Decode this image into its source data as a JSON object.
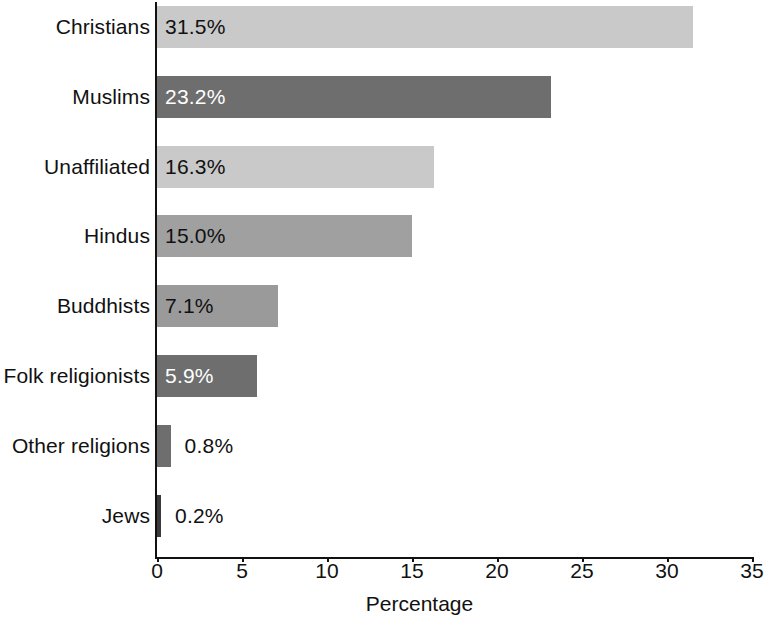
{
  "chart_data": {
    "type": "bar",
    "orientation": "horizontal",
    "title": "",
    "xlabel": "Percentage",
    "ylabel": "",
    "xlim": [
      0,
      35
    ],
    "xticks": [
      "0",
      "5",
      "10",
      "15",
      "20",
      "25",
      "30",
      "35"
    ],
    "grid": false,
    "legend": "none",
    "categories": [
      "Christians",
      "Muslims",
      "Unaffiliated",
      "Hindus",
      "Buddhists",
      "Folk religionists",
      "Other religions",
      "Jews"
    ],
    "values": [
      31.5,
      23.2,
      16.3,
      15.0,
      7.1,
      5.9,
      0.8,
      0.2
    ],
    "value_labels": [
      "31.5%",
      "23.2%",
      "16.3%",
      "15.0%",
      "7.1%",
      "5.9%",
      "0.8%",
      "0.2%"
    ],
    "bar_colors": [
      "#c9c9c9",
      "#6e6e6e",
      "#c9c9c9",
      "#a0a0a0",
      "#9a9a9a",
      "#6e6e6e",
      "#6e6e6e",
      "#3a3a3a"
    ],
    "label_text_colors": [
      "#111111",
      "#ffffff",
      "#111111",
      "#111111",
      "#111111",
      "#ffffff",
      "#111111",
      "#111111"
    ],
    "label_placement": [
      "inside",
      "inside",
      "inside",
      "inside",
      "inside",
      "inside",
      "outside",
      "outside"
    ],
    "axis_color": "#111111",
    "background_color": "#ffffff"
  }
}
